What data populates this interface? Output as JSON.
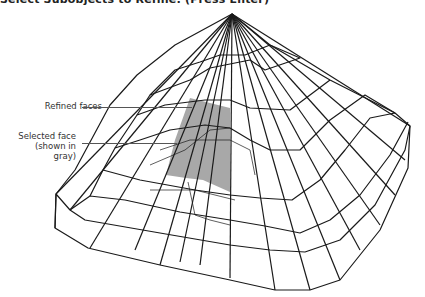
{
  "prompt": {
    "text": "Select Subobjects to Refine: (Press Enter)"
  },
  "figure": {
    "selected_face_color": "#a8a8a8",
    "line_color": "#1a1a1a",
    "callouts": [
      {
        "id": "refined",
        "label": "Refined faces"
      },
      {
        "id": "selected",
        "label_line1": "Selected face",
        "label_line2": "(shown in gray)"
      }
    ]
  }
}
